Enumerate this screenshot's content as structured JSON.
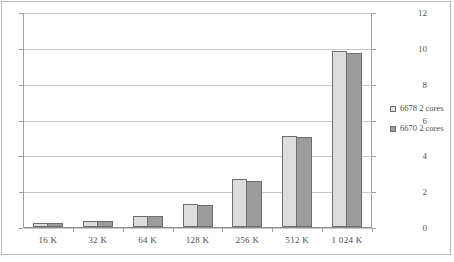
{
  "chart_data": {
    "type": "bar",
    "title": "",
    "subtitle": "",
    "xlabel": "",
    "ylabel": "",
    "categories": [
      "16 K",
      "32 K",
      "64 K",
      "128 K",
      "256 K",
      "512 K",
      "1 024 K"
    ],
    "series": [
      {
        "name": "6678 2 cores",
        "color": "#dcdcdc",
        "values": [
          0.2,
          0.35,
          0.6,
          1.3,
          2.7,
          5.1,
          9.85
        ]
      },
      {
        "name": "6670 2 cores",
        "color": "#9c9c9c",
        "values": [
          0.2,
          0.35,
          0.6,
          1.25,
          2.55,
          5.0,
          9.7
        ]
      }
    ],
    "ylim": [
      0,
      12
    ],
    "yticks": [
      0,
      2,
      4,
      6,
      8,
      10,
      12
    ],
    "ytick_labels": [
      "0",
      "2",
      "4",
      "6",
      "8",
      "10",
      "12"
    ],
    "grid": true,
    "legend_position": "right"
  },
  "legend": {
    "entries": [
      {
        "label": "6678 2 cores"
      },
      {
        "label": "6670 2 cores"
      }
    ]
  }
}
